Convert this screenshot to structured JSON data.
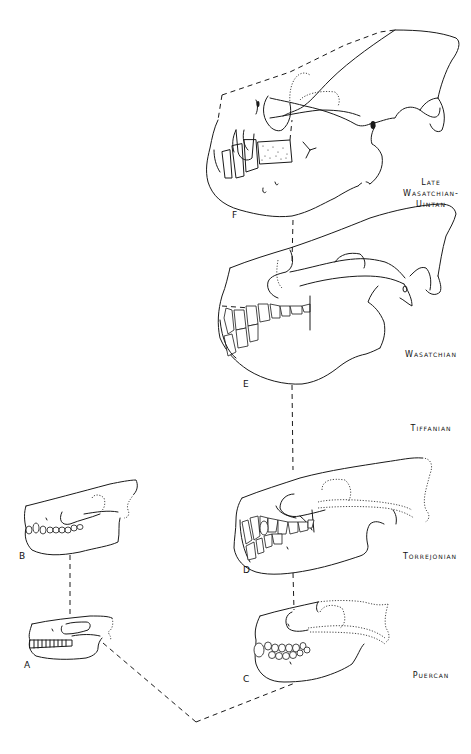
{
  "figure": {
    "type": "phylogenetic-skull-diagram",
    "stages": [
      {
        "id": "late-wasatchian-uintan",
        "lines": [
          "Late",
          "Wasatchian-",
          "Uintan"
        ]
      },
      {
        "id": "wasatchian",
        "lines": [
          "Wasatchian"
        ]
      },
      {
        "id": "tiffanian",
        "lines": [
          "Tiffanian"
        ]
      },
      {
        "id": "torrejonian",
        "lines": [
          "Torrejonian"
        ]
      },
      {
        "id": "puercan",
        "lines": [
          "Puercan"
        ]
      }
    ],
    "specimens": [
      {
        "letter": "A",
        "stage": "Puercan",
        "lineage": "left"
      },
      {
        "letter": "B",
        "stage": "Torrejonian",
        "lineage": "left"
      },
      {
        "letter": "C",
        "stage": "Puercan",
        "lineage": "right"
      },
      {
        "letter": "D",
        "stage": "Torrejonian",
        "lineage": "right"
      },
      {
        "letter": "E",
        "stage": "Wasatchian",
        "lineage": "right"
      },
      {
        "letter": "F",
        "stage": "Late Wasatchian-Uintan",
        "lineage": "right"
      }
    ],
    "connections": [
      [
        "A",
        "B"
      ],
      [
        "A",
        "root"
      ],
      [
        "C",
        "root"
      ],
      [
        "C",
        "D"
      ],
      [
        "D",
        "E"
      ],
      [
        "E",
        "F"
      ]
    ]
  },
  "labels": {
    "late": "Late",
    "wasatchian_dash": "Wasatchian-",
    "uintan": "Uintan",
    "wasatchian": "Wasatchian",
    "tiffanian": "Tiffanian",
    "torrejonian": "Torrejonian",
    "puercan": "Puercan",
    "A": "A",
    "B": "B",
    "C": "C",
    "D": "D",
    "E": "E",
    "F": "F"
  }
}
